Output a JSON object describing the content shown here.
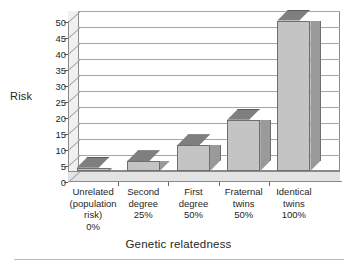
{
  "chart_data": {
    "type": "bar",
    "title": "",
    "subtitle": "",
    "xlabel": "Genetic relatedness",
    "ylabel": "Risk",
    "ylim": [
      0,
      50
    ],
    "yticks": [
      0,
      5,
      10,
      15,
      20,
      25,
      30,
      35,
      40,
      45,
      50
    ],
    "grid": true,
    "legend": false,
    "legend_position": "none",
    "style": "3d-column",
    "bar_color": "#c4c4c4",
    "bar_side_color": "#9a9a9a",
    "bar_top_color": "#7f7f7f",
    "plot_background": "#ffffff",
    "gridline_color": "#a6a6a6",
    "axis_color": "#8a8a8a",
    "categories": [
      "Unrelated (population risk) 0%",
      "Second degree 25%",
      "First degree 50%",
      "Fraternal twins 50%",
      "Identical twins 100%"
    ],
    "category_lines": [
      [
        "Unrelated",
        "(population",
        "risk)",
        "0%"
      ],
      [
        "Second",
        "degree",
        "25%"
      ],
      [
        "First",
        "degree",
        "50%"
      ],
      [
        "Fraternal",
        "twins",
        "50%"
      ],
      [
        "Identical",
        "twins",
        "100%"
      ]
    ],
    "values": [
      1,
      3,
      8,
      16,
      47
    ],
    "series": [
      {
        "name": "Risk",
        "values": [
          1,
          3,
          8,
          16,
          47
        ]
      }
    ]
  },
  "axes": {
    "y_title": "Risk",
    "x_title": "Genetic relatedness",
    "y_tick_labels": [
      "0",
      "5",
      "10",
      "15",
      "20",
      "25",
      "30",
      "35",
      "40",
      "45",
      "50"
    ]
  }
}
